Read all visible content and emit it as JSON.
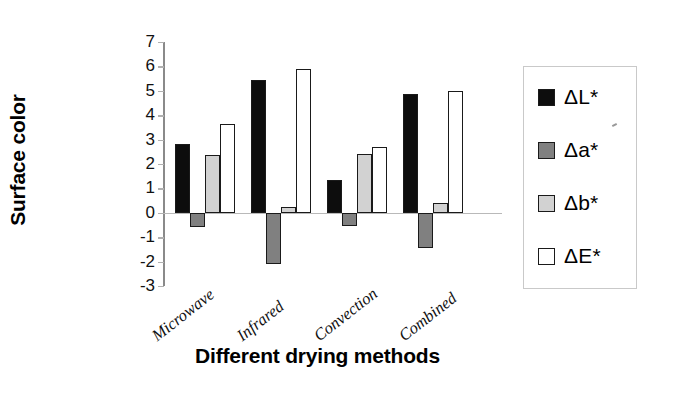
{
  "chart_data": {
    "type": "bar",
    "title": "",
    "xlabel": "Different drying methods",
    "ylabel": "Surface color",
    "categories": [
      "Microwave",
      "Infrared",
      "Convection",
      "Combined"
    ],
    "series": [
      {
        "name": "ΔL*",
        "color": "#0d0d0d",
        "values": [
          2.8,
          5.45,
          1.35,
          4.85
        ]
      },
      {
        "name": "Δa*",
        "color": "#808080",
        "values": [
          -0.6,
          -2.1,
          -0.55,
          -1.45
        ]
      },
      {
        "name": "Δb*",
        "color": "#d2d2d2",
        "values": [
          2.35,
          0.25,
          2.4,
          0.4
        ]
      },
      {
        "name": "ΔE*",
        "color": "#ffffff",
        "values": [
          3.65,
          5.9,
          2.7,
          5.0
        ]
      }
    ],
    "ylim": [
      -3,
      7
    ],
    "ytick_labels": [
      "7",
      "6",
      "5",
      "4",
      "3",
      "2",
      "1",
      "0",
      "-1",
      "-2",
      "-3"
    ],
    "ytick_values": [
      7,
      6,
      5,
      4,
      3,
      2,
      1,
      0,
      -1,
      -2,
      -3
    ],
    "grid": false,
    "legend_position": "right",
    "legend_entries": [
      "ΔL*",
      "Δa*",
      "Δb*",
      "ΔE*"
    ]
  }
}
